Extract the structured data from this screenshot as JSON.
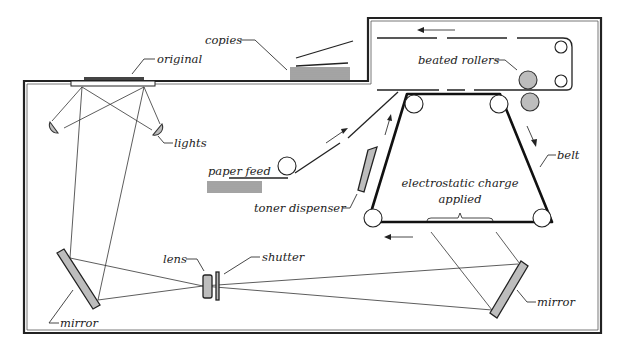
{
  "diagram": {
    "labels": {
      "copies": "copies",
      "original": "original",
      "heated_rollers": "beated rollers",
      "lights": "lights",
      "paper_feed": "paper feed",
      "belt": "belt",
      "toner_dispenser": "toner dispenser",
      "electrostatic_line1": "electrostatic charge",
      "electrostatic_line2": "applied",
      "lens": "lens",
      "shutter": "shutter",
      "mirror_left": "mirror",
      "mirror_right": "mirror"
    },
    "colors": {
      "line": "#222222",
      "fill_gray": "#bdbdbd",
      "background": "#ffffff"
    }
  }
}
